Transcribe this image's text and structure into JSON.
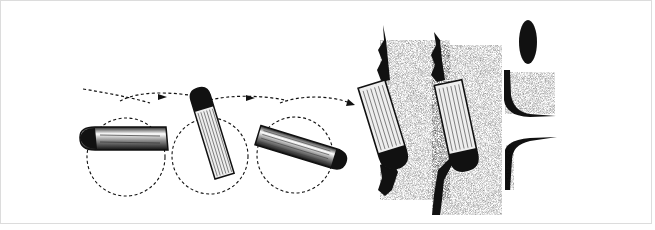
{
  "figure": {
    "type": "illustration",
    "frame_color": "#dcdcdc",
    "ink_color": "#111111",
    "background": "#ffffff",
    "panels": [
      {
        "name": "tumble-sequence",
        "bullets": 3,
        "dashed_circles": 3,
        "trajectory_arrows": 3
      },
      {
        "name": "tissue-penetration-1"
      },
      {
        "name": "tissue-penetration-2"
      },
      {
        "name": "wound-channel"
      }
    ]
  }
}
